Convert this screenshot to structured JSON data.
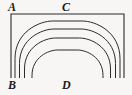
{
  "figure": {
    "background_color": "#f7f6f4",
    "stroke_color": "#2b2b2b",
    "labels": {
      "top_left": "A",
      "top_center": "C",
      "bottom_left": "B",
      "bottom_center": "D"
    },
    "frame": {
      "left_x": 11,
      "right_x": 124,
      "top_y": 14,
      "bottom_y": 78,
      "bottom_open": true
    },
    "arches": [
      {
        "index": 1,
        "left_x": 15,
        "right_x": 120,
        "apex_y": 21,
        "bottom_y": 78
      },
      {
        "index": 2,
        "left_x": 19.5,
        "right_x": 115.5,
        "apex_y": 29,
        "bottom_y": 78
      },
      {
        "index": 3,
        "left_x": 24.5,
        "right_x": 110.5,
        "apex_y": 38,
        "bottom_y": 78
      },
      {
        "index": 4,
        "left_x": 32,
        "right_x": 103,
        "apex_y": 50,
        "bottom_y": 78
      }
    ]
  },
  "chart_data": {
    "type": "line",
    "xlabel": "",
    "ylabel": "",
    "series": [
      {
        "name": "frame",
        "x": [
          11,
          11,
          124,
          124
        ],
        "y": [
          78,
          14,
          14,
          78
        ]
      },
      {
        "name": "arch-1",
        "x": [
          15,
          15,
          67.5,
          120,
          120
        ],
        "y": [
          78,
          40,
          21,
          40,
          78
        ]
      },
      {
        "name": "arch-2",
        "x": [
          19.5,
          19.5,
          67.5,
          115.5,
          115.5
        ],
        "y": [
          78,
          46,
          29,
          46,
          78
        ]
      },
      {
        "name": "arch-3",
        "x": [
          24.5,
          24.5,
          67.5,
          110.5,
          110.5
        ],
        "y": [
          78,
          53,
          38,
          53,
          78
        ]
      },
      {
        "name": "arch-4",
        "x": [
          32,
          32,
          67.5,
          103,
          103
        ],
        "y": [
          78,
          62,
          50,
          62,
          78
        ]
      }
    ],
    "annotations": [
      {
        "text": "A",
        "x": 10,
        "y": 7
      },
      {
        "text": "C",
        "x": 66,
        "y": 7
      },
      {
        "text": "B",
        "x": 10,
        "y": 85
      },
      {
        "text": "D",
        "x": 66,
        "y": 85
      }
    ],
    "grid": false,
    "legend": "none",
    "xlim": [
      0,
      132
    ],
    "ylim": [
      95,
      0
    ]
  }
}
